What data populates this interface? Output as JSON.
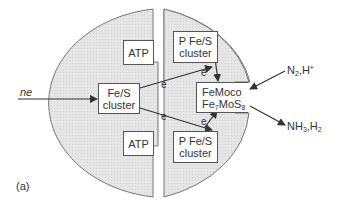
{
  "figure": {
    "panel_label": "(a)",
    "input_label": "ne",
    "colors": {
      "shade": "#e4e4e4",
      "stroke": "#666666",
      "arrow": "#333333"
    }
  },
  "nodes": {
    "fes_cluster": {
      "line1": "Fe/S",
      "line2": "cluster"
    },
    "atp_top": {
      "label": "ATP"
    },
    "atp_bottom": {
      "label": "ATP"
    },
    "pfes_top": {
      "line1": "P Fe/S",
      "line2": "cluster"
    },
    "pfes_bottom": {
      "line1": "P Fe/S",
      "line2": "cluster"
    },
    "femoco": {
      "line1": "FeMoco",
      "line2_main": "Fe",
      "line2_sub1": "7",
      "line2_mid": "MoS",
      "line2_sub2": "8"
    }
  },
  "electron_labels": [
    "e",
    "e",
    "e",
    "e"
  ],
  "substrates": {
    "n2": "N",
    "n2_sub": "2",
    "n2_rest": ",H",
    "n2_sup": "+"
  },
  "products": {
    "nh3": "NH",
    "nh3_sub": "3",
    "nh3_rest": ",H",
    "h2_sub": "2"
  }
}
